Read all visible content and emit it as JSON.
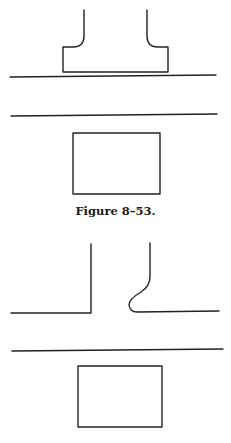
{
  "figure_top": {
    "caption": "Figure 8–53.",
    "description": "Driveway with flared returns meeting roadway; parked vehicle/structure across street"
  },
  "figure_bottom": {
    "caption": "",
    "description": "Driveway with one square corner and one curved return meeting roadway; rectangle across street"
  },
  "colors": {
    "line": "#222222",
    "background": "#ffffff"
  }
}
